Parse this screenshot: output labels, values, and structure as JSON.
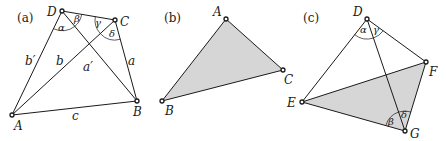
{
  "panels": [
    {
      "id": "a",
      "label": "(a)",
      "vertices": {
        "A": "A",
        "B": "B",
        "C": "C",
        "D": "D"
      },
      "sides": {
        "a": "a",
        "b": "b",
        "c": "c",
        "a_prime": "a′",
        "b_prime": "b′"
      },
      "angles": {
        "alpha": "α",
        "beta": "β",
        "gamma": "γ",
        "delta": "δ"
      }
    },
    {
      "id": "b",
      "label": "(b)",
      "vertices": {
        "A": "A",
        "B": "B",
        "C": "C"
      },
      "fill": "#d6d6d6"
    },
    {
      "id": "c",
      "label": "(c)",
      "vertices": {
        "D": "D",
        "E": "E",
        "F": "F",
        "G": "G"
      },
      "angles": {
        "alpha": "α",
        "gamma": "γ",
        "beta": "β",
        "delta": "δ"
      },
      "fill": "#d6d6d6"
    }
  ]
}
